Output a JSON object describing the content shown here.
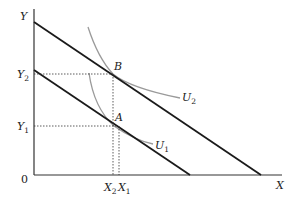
{
  "diagram": {
    "type": "indifference-curve-budget-line",
    "axes": {
      "x_label": "X",
      "y_label": "Y",
      "origin_label": "0"
    },
    "budget_lines": [
      {
        "name": "original",
        "y_intercept": "Y-top",
        "x_intercept": "far"
      },
      {
        "name": "shifted",
        "y_intercept": "lower",
        "x_intercept": "near"
      }
    ],
    "points": [
      {
        "label": "B",
        "on": "U2",
        "y_tick": {
          "main": "Y",
          "sub": "2"
        },
        "x_tick": {
          "main": "X",
          "sub": "2"
        }
      },
      {
        "label": "A",
        "on": "U1",
        "y_tick": {
          "main": "Y",
          "sub": "1"
        },
        "x_tick": {
          "main": "X",
          "sub": "1"
        }
      }
    ],
    "curves": [
      {
        "label": {
          "main": "U",
          "sub": "2"
        }
      },
      {
        "label": {
          "main": "U",
          "sub": "1"
        }
      }
    ],
    "colors": {
      "axis": "#333333",
      "budget_line": "#1a1a1a",
      "indifference_curve": "#9a9a9a",
      "guide": "#333333"
    }
  }
}
